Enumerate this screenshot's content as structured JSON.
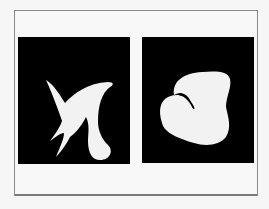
{
  "figure": {
    "panels": [
      {
        "id": "left",
        "shape": "spiky-shape",
        "fill": "#f2f2f2",
        "background": "#000000"
      },
      {
        "id": "right",
        "shape": "rounded-blob-shape",
        "fill": "#f2f2f2",
        "background": "#000000"
      }
    ],
    "frame_color": "#8a8a8a",
    "page_background": "#f6f6f6"
  }
}
